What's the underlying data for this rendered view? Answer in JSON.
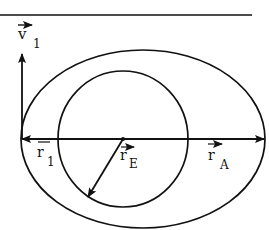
{
  "diagram": {
    "type": "orbit-transfer",
    "colors": {
      "stroke": "#111111",
      "background": "#ffffff"
    },
    "labels": {
      "v1": {
        "base": "v",
        "sub": "1"
      },
      "r1": {
        "base": "r",
        "sub": "1"
      },
      "rE": {
        "base": "r",
        "sub": "E"
      },
      "rA": {
        "base": "r",
        "sub": "A"
      }
    },
    "elements": {
      "top_rule": "horizontal rule",
      "outer_orbit": "ellipse (transfer orbit)",
      "inner_orbit": "circle (Earth orbit)",
      "axis": "apse line with arrow to apoapsis",
      "velocity_vector": "v1 perpendicular at periapsis",
      "radius_vector_periapsis": "r1",
      "radius_vector_circle": "rE",
      "radius_vector_apoapsis": "rA"
    }
  }
}
